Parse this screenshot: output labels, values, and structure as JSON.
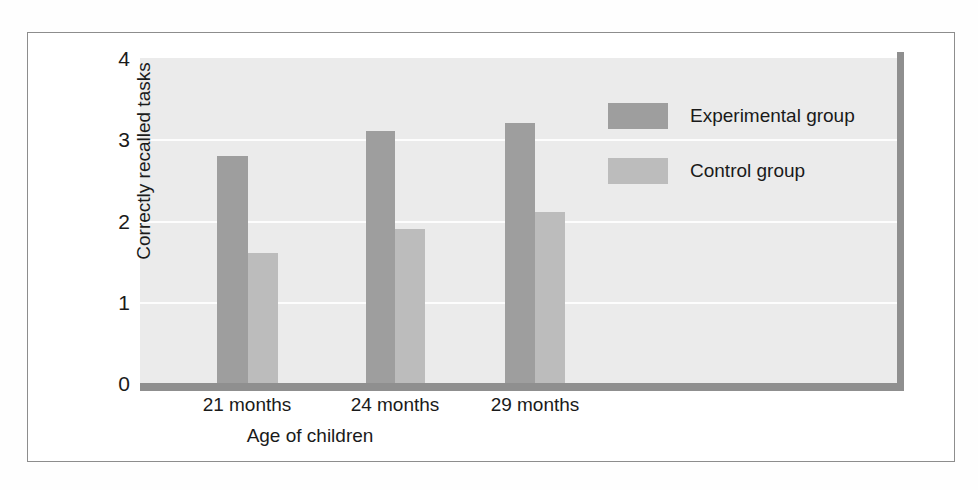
{
  "chart_data": {
    "type": "bar",
    "title": "",
    "xlabel": "Age of children",
    "ylabel": "Correctly recalled tasks",
    "categories": [
      "21 months",
      "24 months",
      "29 months"
    ],
    "series": [
      {
        "name": "Experimental group",
        "values": [
          2.8,
          3.1,
          3.2
        ],
        "color": "#9e9e9e"
      },
      {
        "name": "Control group",
        "values": [
          1.6,
          1.9,
          2.1
        ],
        "color": "#bcbcbc"
      }
    ],
    "ylim": [
      0,
      4
    ],
    "yticks": [
      0,
      1,
      2,
      3,
      4
    ],
    "ytick_labels": [
      "0",
      "1",
      "2",
      "3",
      "4"
    ],
    "grid": "horizontal",
    "legend_position": "upper-right",
    "plot_background": "#ebebeb",
    "gridline_color": "#fdfdfd",
    "axis_color": "#8f8f8f"
  },
  "axes": {
    "y_title": "Correctly recalled tasks",
    "x_title": "Age of children",
    "y_labels": [
      "4",
      "3",
      "2",
      "1",
      "0"
    ],
    "x_labels": [
      "21 months",
      "24 months",
      "29 months"
    ]
  },
  "legend": {
    "items": [
      {
        "label": "Experimental group",
        "color": "#9e9e9e"
      },
      {
        "label": "Control group",
        "color": "#bcbcbc"
      }
    ]
  }
}
